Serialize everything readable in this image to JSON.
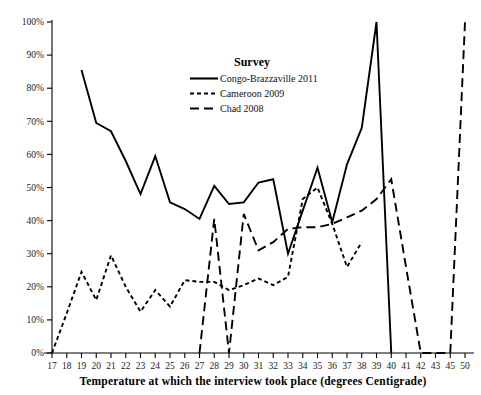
{
  "chart_data": {
    "type": "line",
    "title": "",
    "xlabel": "Temperature at which the interview took place (degrees Centigrade)",
    "ylabel": "",
    "legend_title": "Survey",
    "legend_position": "top-center-right",
    "grid": false,
    "categories": [
      "17",
      "18",
      "19",
      "20",
      "21",
      "22",
      "23",
      "24",
      "25",
      "26",
      "27",
      "28",
      "29",
      "30",
      "31",
      "32",
      "33",
      "34",
      "35",
      "36",
      "37",
      "38",
      "39",
      "40",
      "41",
      "42",
      "43",
      "45",
      "50"
    ],
    "xlim": [
      "17",
      "50"
    ],
    "ylim": [
      0,
      100
    ],
    "ytick_labels": [
      "0%",
      "10%",
      "20%",
      "30%",
      "40%",
      "50%",
      "60%",
      "70%",
      "80%",
      "90%",
      "100%"
    ],
    "ytick_values": [
      0,
      10,
      20,
      30,
      40,
      50,
      60,
      70,
      80,
      90,
      100
    ],
    "xtick_labels": [
      "17",
      "18",
      "19",
      "20",
      "21",
      "22",
      "23",
      "24",
      "25",
      "26",
      "27",
      "28",
      "29",
      "30",
      "31",
      "32",
      "33",
      "34",
      "35",
      "36",
      "37",
      "38",
      "39",
      "40",
      "41",
      "42",
      "43",
      "45",
      "50"
    ],
    "series": [
      {
        "name": "Congo-Brazzaville 2011",
        "style": "solid",
        "x": [
          "19",
          "20",
          "21",
          "22",
          "23",
          "24",
          "25",
          "26",
          "27",
          "28",
          "29",
          "30",
          "31",
          "32",
          "33",
          "34",
          "35",
          "36",
          "37",
          "38",
          "39",
          "40"
        ],
        "values": [
          85.5,
          69.5,
          67.0,
          58.0,
          48.0,
          59.5,
          45.5,
          43.5,
          40.5,
          50.5,
          45.0,
          45.5,
          51.5,
          52.5,
          30.0,
          43.0,
          56.0,
          39.5,
          57.0,
          68.0,
          100.0,
          0.0
        ]
      },
      {
        "name": "Cameroon 2009",
        "style": "short-dash",
        "x": [
          "17",
          "18",
          "19",
          "20",
          "21",
          "22",
          "23",
          "24",
          "25",
          "26",
          "27",
          "28",
          "29",
          "30",
          "31",
          "32",
          "33",
          "34",
          "35",
          "36",
          "37",
          "38"
        ],
        "values": [
          0.0,
          12.0,
          24.5,
          16.0,
          29.5,
          20.0,
          12.5,
          19.0,
          14.0,
          22.0,
          21.5,
          21.5,
          19.0,
          20.5,
          22.5,
          20.5,
          23.0,
          46.5,
          50.0,
          39.0,
          26.0,
          33.5
        ]
      },
      {
        "name": "Chad 2008",
        "style": "long-dash",
        "x": [
          "27",
          "28",
          "29",
          "30",
          "31",
          "32",
          "33",
          "34",
          "35",
          "36",
          "37",
          "38",
          "39",
          "40",
          "41",
          "42",
          "43",
          "45",
          "50"
        ],
        "values": [
          0.0,
          40.5,
          0.0,
          42.0,
          31.0,
          33.5,
          37.5,
          38.0,
          38.0,
          39.0,
          41.0,
          43.0,
          46.5,
          52.5,
          26.0,
          0.0,
          0.0,
          0.0,
          100.0
        ]
      }
    ]
  },
  "legend": {
    "title": "Survey",
    "entries": [
      {
        "label": "Congo-Brazzaville 2011",
        "style": "solid"
      },
      {
        "label": "Cameroon 2009",
        "style": "short-dash"
      },
      {
        "label": "Chad 2008",
        "style": "long-dash"
      }
    ]
  },
  "axes": {
    "x_title": "Temperature at which the interview took place (degrees Centigrade)"
  }
}
